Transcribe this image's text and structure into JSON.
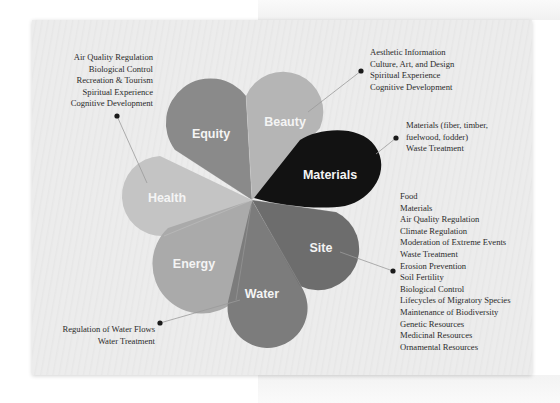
{
  "diagram": {
    "center": [
      252,
      200
    ],
    "petals": [
      {
        "id": "equity",
        "label": "Equity",
        "color": "#8a8a8a"
      },
      {
        "id": "beauty",
        "label": "Beauty",
        "color": "#b5b5b5"
      },
      {
        "id": "materials",
        "label": "Materials",
        "color": "#121212"
      },
      {
        "id": "site",
        "label": "Site",
        "color": "#6d6d6d"
      },
      {
        "id": "water",
        "label": "Water",
        "color": "#7c7c7c"
      },
      {
        "id": "energy",
        "label": "Energy",
        "color": "#aaaaaa"
      },
      {
        "id": "health",
        "label": "Health",
        "color": "#c4c4c4"
      }
    ],
    "callouts": {
      "health": [
        "Air Quality Regulation",
        "Biological Control",
        "Recreation & Tourism",
        "Spiritual Experience",
        "Cognitive Development"
      ],
      "beauty": [
        "Aesthetic Information",
        "Culture, Art, and Design",
        "Spiritual Experience",
        "Cognitive Development"
      ],
      "materials": [
        "Materials (fiber, timber,",
        "fuelwood, fodder)",
        "Waste Treatment"
      ],
      "site": [
        "Food",
        "Materials",
        "Air Quality Regulation",
        "Climate Regulation",
        "Moderation of Extreme Events",
        "Waste Treatment",
        "Erosion Prevention",
        "Soil Fertility",
        "Biological Control",
        "Lifecycles of Migratory Species",
        "Maintenance of Biodiversity",
        "Genetic Resources",
        "Medicinal Resources",
        "Ornamental Resources"
      ],
      "water": [
        "Regulation of Water Flows",
        "Water Treatment"
      ]
    }
  }
}
